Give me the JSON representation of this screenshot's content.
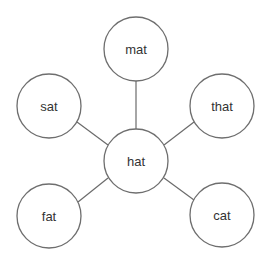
{
  "diagram": {
    "type": "hub-and-spoke",
    "center": "hat",
    "nodes": [
      {
        "id": "hat",
        "label": "hat",
        "cx": 136,
        "cy": 161,
        "r": 32
      },
      {
        "id": "mat",
        "label": "mat",
        "cx": 136,
        "cy": 49,
        "r": 32
      },
      {
        "id": "sat",
        "label": "sat",
        "cx": 49,
        "cy": 106,
        "r": 32
      },
      {
        "id": "that",
        "label": "that",
        "cx": 222,
        "cy": 106,
        "r": 32
      },
      {
        "id": "fat",
        "label": "fat",
        "cx": 49,
        "cy": 216,
        "r": 32
      },
      {
        "id": "cat",
        "label": "cat",
        "cx": 222,
        "cy": 215,
        "r": 32
      }
    ],
    "edges": [
      {
        "from": "hat",
        "to": "mat"
      },
      {
        "from": "hat",
        "to": "sat"
      },
      {
        "from": "hat",
        "to": "that"
      },
      {
        "from": "hat",
        "to": "fat"
      },
      {
        "from": "hat",
        "to": "cat"
      }
    ]
  }
}
